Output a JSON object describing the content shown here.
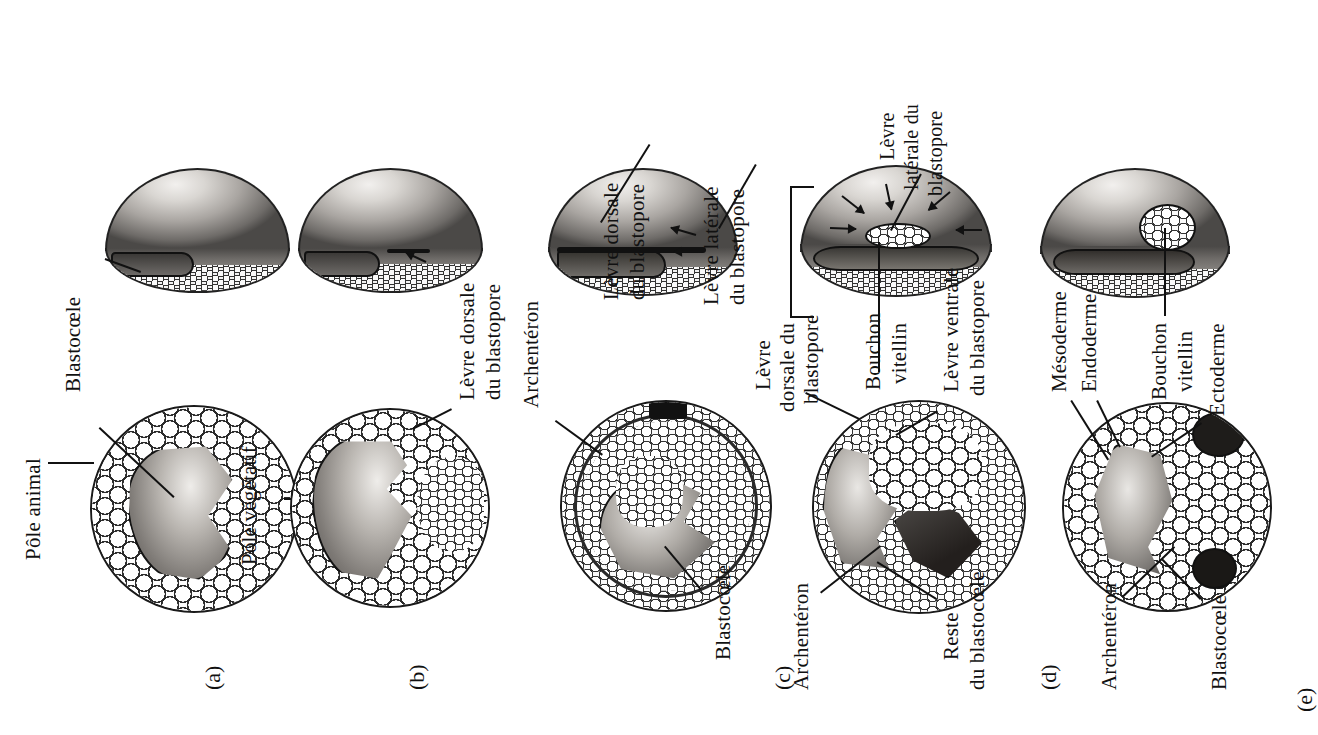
{
  "figure": {
    "title_visible": false,
    "orientation": "rotated-90-ccw",
    "language": "fr"
  },
  "panels": [
    {
      "id": "(a)",
      "labels": [
        {
          "name": "pole-animal",
          "text": "Pôle animal"
        },
        {
          "name": "blastocoele",
          "text": "Blastocœle"
        },
        {
          "name": "pole-vegetatif",
          "text": "Pôle végétatif"
        }
      ]
    },
    {
      "id": "(b)",
      "labels": [
        {
          "name": "levre-dorsale-blastopore",
          "line1": "Lèvre dorsale",
          "line2": "du blastopore"
        }
      ]
    },
    {
      "id": "(c)",
      "labels": [
        {
          "name": "levre-dorsale-blastopore-3d",
          "line1": "Lèvre dorsale",
          "line2": "du blastopore"
        },
        {
          "name": "levre-laterale-blastopore-3d",
          "line1": "Lèvre latérale",
          "line2": "du blastopore"
        },
        {
          "name": "archenteron",
          "text": "Archentéron"
        },
        {
          "name": "blastocoele",
          "text": "Blastocœle"
        }
      ]
    },
    {
      "id": "(c)",
      "second_stage": true,
      "labels": [
        {
          "name": "levre-laterale-blastopore",
          "line1": "Lèvre",
          "line2": "latérale du",
          "line3": "blastopore"
        },
        {
          "name": "levre-dorsale-blastopore",
          "line1": "Lèvre",
          "line2": "dorsale du",
          "line3": "blastopore"
        },
        {
          "name": "bouchon-vitellin",
          "line1": "Bouchon",
          "line2": "vitellin"
        },
        {
          "name": "levre-ventrale-blastopore",
          "line1": "Lèvre ventrale",
          "line2": "du blastopore"
        },
        {
          "name": "reste-blastocoele",
          "line1": "Reste",
          "line2": "du blastocœle"
        },
        {
          "name": "archenteron",
          "text": "Archentéron"
        }
      ]
    },
    {
      "id": "(d)",
      "labels": [
        {
          "name": "mesoderme",
          "text": "Mésoderme"
        },
        {
          "name": "endoderme",
          "text": "Endoderme"
        },
        {
          "name": "archenteron",
          "text": "Archentéron"
        },
        {
          "name": "bouchon-vitellin",
          "line1": "Bouchon",
          "line2": "vitellin"
        }
      ]
    },
    {
      "id": "(e)",
      "labels": [
        {
          "name": "ectoderme",
          "text": "Ectoderme"
        },
        {
          "name": "blastocoele",
          "text": "Blastocœle"
        }
      ]
    }
  ],
  "text": {
    "pole_animal": "Pôle animal",
    "pole_vegetatif": "Pôle végétatif",
    "blastocoele": "Blastocœle",
    "blastocoele_e": "Blastocœle",
    "levre_dorsale_1": "Lèvre dorsale",
    "levre_dorsale_2": "du blastopore",
    "levre_dorsale_c_1": "Lèvre dorsale",
    "levre_dorsale_c_2": "du blastopore",
    "levre_laterale_c_1": "Lèvre latérale",
    "levre_laterale_c_2": "du blastopore",
    "archenteron_b": "Archentéron",
    "archenteron_c": "Archentéron",
    "archenteron_d": "Archentéron",
    "levre_laterale_d_1": "Lèvre",
    "levre_laterale_d_2": "latérale du",
    "levre_laterale_d_3": "blastopore",
    "levre_dorsale_d_1": "Lèvre",
    "levre_dorsale_d_2": "dorsale du",
    "levre_dorsale_d_3": "blastopore",
    "bouchon_vitellin_1": "Bouchon",
    "bouchon_vitellin_2": "vitellin",
    "bouchon_vitellin_d_1": "Bouchon",
    "bouchon_vitellin_d_2": "vitellin",
    "levre_ventrale_1": "Lèvre ventrale",
    "levre_ventrale_2": "du blastopore",
    "reste_blastocoele_1": "Reste",
    "reste_blastocoele_2": "du blastocœle",
    "mesoderme": "Mésoderme",
    "endoderme": "Endoderme",
    "ectoderme": "Ectoderme",
    "panel_a": "(a)",
    "panel_b": "(b)",
    "panel_c": "(c)",
    "panel_d": "(d)",
    "panel_e": "(e)"
  },
  "colors": {
    "ink": "#111111",
    "background": "#ffffff",
    "yolk_light": "#c9c5c0",
    "yolk_dark": "#55524f"
  }
}
